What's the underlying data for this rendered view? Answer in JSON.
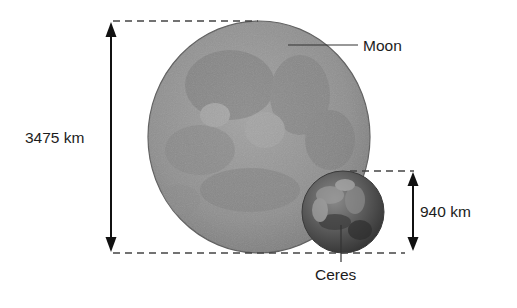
{
  "diagram": {
    "bodies": [
      {
        "name": "Moon",
        "diameter_label": "3475 km",
        "color": "#8e8e8e"
      },
      {
        "name": "Ceres",
        "diameter_label": "940 km",
        "color": "#5a5a5a"
      }
    ],
    "colors": {
      "line": "#111111",
      "dash": "#444444",
      "text": "#1c1c1c"
    }
  },
  "labels": {
    "moon": "Moon",
    "ceres": "Ceres",
    "moon_diameter": "3475 km",
    "ceres_diameter": "940 km"
  }
}
